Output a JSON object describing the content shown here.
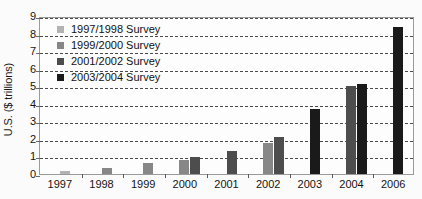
{
  "chart_data": {
    "type": "bar",
    "title": "",
    "subtitle": "",
    "xlabel": "",
    "ylabel": "U.S. ($ trillions)",
    "categories": [
      "1997",
      "1998",
      "1999",
      "2000",
      "2001",
      "2002",
      "2003",
      "2004",
      "2006"
    ],
    "ylim": [
      0,
      9
    ],
    "yticks": [
      0,
      1,
      2,
      3,
      4,
      5,
      6,
      7,
      8,
      9
    ],
    "ytick_labels": [
      "0",
      "1",
      "2",
      "3",
      "4",
      "5",
      "6",
      "7",
      "8",
      "9"
    ],
    "grid": true,
    "grid_axis": "y",
    "grid_style": "dashed",
    "legend_position": "upper-left-inside",
    "series": [
      {
        "name": "1997/1998 Survey",
        "color": "#b3b3b3",
        "values": [
          0.2,
          null,
          null,
          null,
          null,
          null,
          null,
          null,
          null
        ]
      },
      {
        "name": "1999/2000 Survey",
        "color": "#878787",
        "values": [
          null,
          0.35,
          0.65,
          0.8,
          null,
          1.75,
          null,
          null,
          null
        ]
      },
      {
        "name": "2001/2002 Survey",
        "color": "#4d4d4d",
        "values": [
          null,
          null,
          null,
          0.95,
          1.3,
          2.1,
          null,
          5.0,
          null
        ]
      },
      {
        "name": "2003/2004 Survey",
        "color": "#1a1a1a",
        "values": [
          null,
          null,
          null,
          null,
          null,
          null,
          3.7,
          5.15,
          8.4
        ]
      }
    ],
    "points": [
      {
        "category": "1997",
        "series": "1997/1998 Survey",
        "value": 0.2
      },
      {
        "category": "1998",
        "series": "1999/2000 Survey",
        "value": 0.35
      },
      {
        "category": "1999",
        "series": "1999/2000 Survey",
        "value": 0.65
      },
      {
        "category": "2000",
        "series": "1999/2000 Survey",
        "value": 0.8
      },
      {
        "category": "2000",
        "series": "2001/2002 Survey",
        "value": 0.95
      },
      {
        "category": "2001",
        "series": "2001/2002 Survey",
        "value": 1.3
      },
      {
        "category": "2002",
        "series": "1999/2000 Survey",
        "value": 1.75
      },
      {
        "category": "2002",
        "series": "2001/2002 Survey",
        "value": 2.1
      },
      {
        "category": "2003",
        "series": "2003/2004 Survey",
        "value": 3.7
      },
      {
        "category": "2004",
        "series": "2001/2002 Survey",
        "value": 5.0
      },
      {
        "category": "2004",
        "series": "2003/2004 Survey",
        "value": 5.15
      },
      {
        "category": "2006",
        "series": "2003/2004 Survey",
        "value": 8.4
      }
    ]
  },
  "legend": {
    "items": [
      {
        "label": "1997/1998 Survey",
        "color": "#b3b3b3"
      },
      {
        "label": "1999/2000 Survey",
        "color": "#878787"
      },
      {
        "label": "2001/2002 Survey",
        "color": "#4d4d4d"
      },
      {
        "label": "2003/2004 Survey",
        "color": "#1a1a1a"
      }
    ]
  },
  "colors": {
    "background": "#fbfbfb",
    "plot_background": "#fdfdfd",
    "axis": "#9a9a9a",
    "gridline": "#4a4a4a",
    "text": "#141414"
  }
}
